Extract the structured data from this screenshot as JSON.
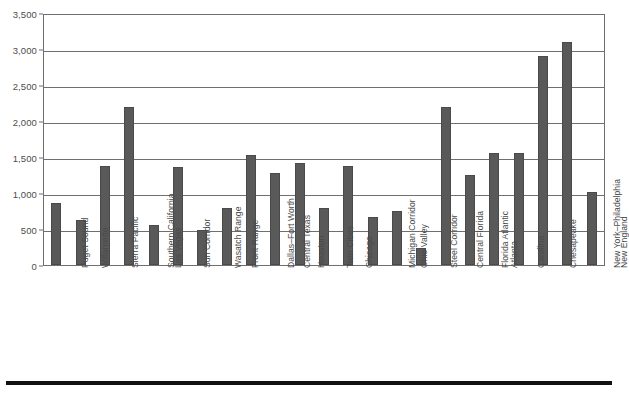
{
  "chart_data": {
    "type": "bar",
    "title": "",
    "subtitle": "",
    "xlabel": "",
    "ylabel": "",
    "ylim": [
      0,
      3500
    ],
    "ytick_step": 500,
    "grid": true,
    "legend": false,
    "bar_color": "#595959",
    "axis_color": "#6f6f6f",
    "yticks": [
      "3,500",
      "3,000",
      "2,500",
      "2,000",
      "1,500",
      "1,000",
      "500",
      "0"
    ],
    "ytick_values": [
      3500,
      3000,
      2500,
      2000,
      1500,
      1000,
      500,
      0
    ],
    "categories": [
      "Puget Sound",
      "Willamette",
      "Sierra Pacific",
      "Southern California",
      "Las Vegas",
      "Sun Corridor",
      "Wasatch Range",
      "Front Range",
      "Dallas–Fort Worth",
      "Central Texas",
      "Houston",
      "Twin Cities",
      "Chicago",
      "Michigan Corridor",
      "Ohio Valley",
      "Steel Corridor",
      "Central Florida",
      "Florida Atlantic",
      "Atlanta",
      "Carolina",
      "Chesapeake",
      "New York–Philadelphia",
      "New England"
    ],
    "values": [
      860,
      620,
      1380,
      2190,
      560,
      1360,
      490,
      790,
      1530,
      1280,
      1410,
      790,
      1375,
      670,
      750,
      230,
      2190,
      1250,
      1550,
      1555,
      2900,
      3100,
      1010
    ]
  },
  "figure": {
    "bottom_rule": "horizontal-rule"
  }
}
